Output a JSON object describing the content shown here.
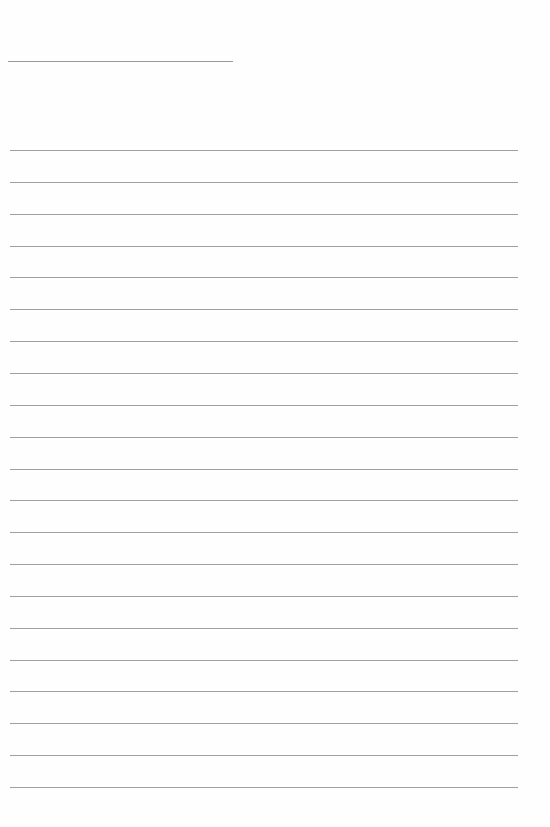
{
  "page": {
    "title_text": "",
    "title_line": {
      "x": 8,
      "y": 61,
      "width": 225
    },
    "ruled_lines": {
      "count": 21,
      "start_y": 150,
      "spacing": 31.85,
      "x": 10,
      "width": 508
    },
    "colors": {
      "background": "#fefefe",
      "line": "#a0a0a0"
    }
  }
}
